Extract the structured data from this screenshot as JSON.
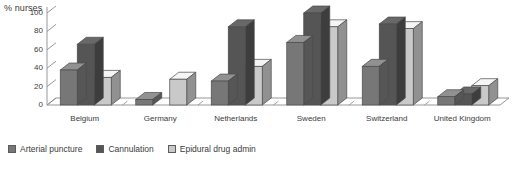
{
  "chart_data": {
    "type": "bar",
    "title": "",
    "subtitle": "",
    "xlabel": "",
    "ylabel": "% nurses",
    "ylim": [
      0,
      100
    ],
    "yticks": [
      0,
      20,
      40,
      60,
      80,
      100
    ],
    "grid": false,
    "legend_position": "bottom-left",
    "style": "3d-clustered-column",
    "categories": [
      "Belgium",
      "Germany",
      "Netherlands",
      "Sweden",
      "Switzerland",
      "United Kingdom"
    ],
    "series": [
      {
        "name": "Arterial puncture",
        "color": "#777777",
        "values": [
          38,
          6,
          26,
          68,
          42,
          9
        ]
      },
      {
        "name": "Cannulation",
        "color": "#555555",
        "values": [
          66,
          0,
          85,
          100,
          88,
          12
        ]
      },
      {
        "name": "Epidural drug admin",
        "color": "#c9c9c9",
        "values": [
          30,
          28,
          42,
          85,
          83,
          21
        ]
      }
    ]
  },
  "axis": {
    "y_title": "% nurses",
    "tick_labels": [
      "100",
      "80",
      "60",
      "40",
      "20",
      "0"
    ]
  },
  "legend": {
    "items": [
      {
        "label": "Arterial puncture"
      },
      {
        "label": "Cannulation"
      },
      {
        "label": "Epidural drug admin"
      }
    ]
  },
  "colors": {
    "series1": "#777777",
    "series2": "#555555",
    "series3": "#c9c9c9",
    "axis": "#8c8c8c",
    "text": "#3b3b3b",
    "background": "#ffffff"
  }
}
